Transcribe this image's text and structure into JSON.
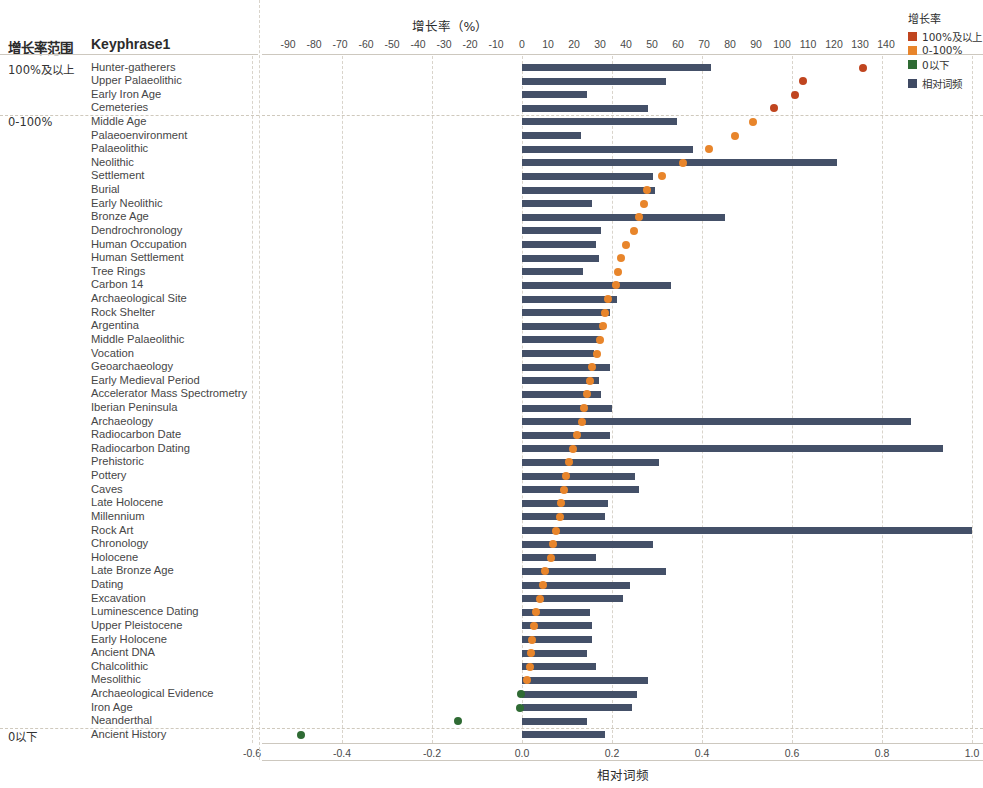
{
  "header": {
    "group_column_header": "增长率范围",
    "keyphrase_column_header": "Keyphrase1"
  },
  "legend": {
    "title": "增长率",
    "items": [
      {
        "label": "100%及以上",
        "color": "#c0451f"
      },
      {
        "label": "0-100%",
        "color": "#e8852b"
      },
      {
        "label": "0以下",
        "color": "#2f6b34"
      },
      {
        "label": "相对词频",
        "color": "#3f4a63"
      }
    ]
  },
  "axes": {
    "top": {
      "title": "增长率（%）",
      "ticks": [
        "-90",
        "-80",
        "-70",
        "-60",
        "-50",
        "-40",
        "-30",
        "-20",
        "-10",
        "0",
        "10",
        "20",
        "30",
        "40",
        "50",
        "60",
        "70",
        "80",
        "90",
        "100",
        "110",
        "120",
        "130",
        "140"
      ],
      "min": -90,
      "max": 140,
      "step": 10
    },
    "bottom": {
      "title": "相对词频",
      "ticks": [
        "-0.6",
        "-0.4",
        "-0.2",
        "0.0",
        "0.2",
        "0.4",
        "0.6",
        "0.8",
        "1.0"
      ],
      "min": -0.7,
      "max": 1.0,
      "step": 0.2
    }
  },
  "groups": [
    {
      "label": "100%及以上",
      "start": 0,
      "count": 4
    },
    {
      "label": "0-100%",
      "start": 4,
      "count": 45
    },
    {
      "label": "0以下",
      "start": 49,
      "count": 4
    }
  ],
  "chart_data": {
    "type": "bar",
    "title": "增长率（%）",
    "xlabel_top": "增长率（%）",
    "xlabel_bottom": "相对词频",
    "ylabel": "Keyphrase1",
    "grid": true,
    "legend_position": "right",
    "series": [
      {
        "name": "相对词频",
        "type": "bar",
        "color": "#445068",
        "axis": "bottom"
      },
      {
        "name": "增长率",
        "type": "scatter",
        "axis": "top"
      }
    ],
    "top_axis_range": [
      -90,
      140
    ],
    "bottom_axis_range": [
      -0.7,
      1.0
    ],
    "categories": [
      "Hunter-gatherers",
      "Upper Palaeolithic",
      "Early Iron Age",
      "Cemeteries",
      "Middle Age",
      "Palaeoenvironment",
      "Palaeolithic",
      "Neolithic",
      "Settlement",
      "Burial",
      "Early Neolithic",
      "Bronze Age",
      "Dendrochronology",
      "Human Occupation",
      "Human Settlement",
      "Tree Rings",
      "Carbon 14",
      "Archaeological Site",
      "Rock Shelter",
      "Argentina",
      "Middle Palaeolithic",
      "Vocation",
      "Geoarchaeology",
      "Early Medieval Period",
      "Accelerator Mass Spectrometry",
      "Iberian Peninsula",
      "Archaeology",
      "Radiocarbon Date",
      "Radiocarbon Dating",
      "Prehistoric",
      "Pottery",
      "Caves",
      "Late Holocene",
      "Millennium",
      "Rock Art",
      "Chronology",
      "Holocene",
      "Late Bronze Age",
      "Dating",
      "Excavation",
      "Luminescence Dating",
      "Upper Pleistocene",
      "Early Holocene",
      "Ancient DNA",
      "Chalcolithic",
      "Mesolithic",
      "Archaeological Evidence",
      "Iron Age",
      "Neanderthal",
      "Ancient History"
    ],
    "relative_frequency": [
      0.42,
      0.32,
      0.145,
      0.28,
      0.345,
      0.13,
      0.38,
      0.7,
      0.29,
      0.295,
      0.155,
      0.45,
      0.175,
      0.165,
      0.17,
      0.135,
      0.33,
      0.21,
      0.195,
      0.18,
      0.175,
      0.16,
      0.195,
      0.17,
      0.175,
      0.2,
      0.865,
      0.195,
      0.935,
      0.305,
      0.25,
      0.26,
      0.19,
      0.185,
      1.0,
      0.29,
      0.165,
      0.32,
      0.24,
      0.225,
      0.15,
      0.155,
      0.155,
      0.145,
      0.165,
      0.28,
      0.255,
      0.245,
      0.145,
      0.185
    ],
    "growth_rate": [
      131.0,
      108.0,
      105.0,
      97.0,
      89.0,
      82.0,
      72.0,
      62.0,
      54.0,
      48.0,
      47.0,
      45.0,
      43.0,
      40.0,
      38.0,
      37.0,
      36.0,
      33.0,
      32.0,
      31.0,
      30.0,
      29.0,
      27.0,
      26.0,
      25.0,
      24.0,
      23.0,
      21.0,
      19.5,
      18.0,
      17.0,
      16.0,
      15.0,
      14.5,
      13.0,
      12.0,
      11.0,
      9.0,
      8.0,
      7.0,
      5.5,
      4.5,
      4.0,
      3.5,
      3.0,
      2.0,
      -0.5,
      -0.8,
      -24.5,
      -85.0
    ],
    "point_colors": [
      "#c0451f",
      "#c0451f",
      "#c0451f",
      "#c0451f",
      "#e8852b",
      "#e8852b",
      "#e8852b",
      "#e8852b",
      "#e8852b",
      "#e8852b",
      "#e8852b",
      "#e8852b",
      "#e8852b",
      "#e8852b",
      "#e8852b",
      "#e8852b",
      "#e8852b",
      "#e8852b",
      "#e8852b",
      "#e8852b",
      "#e8852b",
      "#e8852b",
      "#e8852b",
      "#e8852b",
      "#e8852b",
      "#e8852b",
      "#e8852b",
      "#e8852b",
      "#e8852b",
      "#e8852b",
      "#e8852b",
      "#e8852b",
      "#e8852b",
      "#e8852b",
      "#e8852b",
      "#e8852b",
      "#e8852b",
      "#e8852b",
      "#e8852b",
      "#e8852b",
      "#e8852b",
      "#e8852b",
      "#e8852b",
      "#e8852b",
      "#e8852b",
      "#e8852b",
      "#2f6b34",
      "#2f6b34",
      "#2f6b34",
      "#2f6b34"
    ]
  }
}
